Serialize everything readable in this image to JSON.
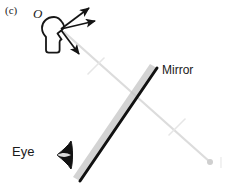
{
  "figure": {
    "panel_label": "(c)",
    "background_color": "#ffffff"
  },
  "labels": {
    "object": "O",
    "mirror": "Mirror",
    "eye": "Eye"
  },
  "colors": {
    "ink": "#1a1a1a",
    "mirror_line": "#111111",
    "mirror_backing": "#b4b4b4",
    "ray_gray": "#d8d8d8",
    "tick_gray": "#e2e2e2",
    "image_point": "#cfcfcf",
    "eye_fill": "#111111"
  },
  "scene": {
    "object_head": {
      "name": "head-silhouette",
      "center_x": 54,
      "center_y": 33
    },
    "emitted_rays": [
      {
        "name": "ray-up-right",
        "x1": 60,
        "y1": 28,
        "x2": 91,
        "y2": 6
      },
      {
        "name": "ray-right",
        "x1": 60,
        "y1": 28,
        "x2": 97,
        "y2": 20
      },
      {
        "name": "ray-down-right",
        "x1": 60,
        "y1": 28,
        "x2": 80,
        "y2": 55
      }
    ],
    "mirror": {
      "x1": 157,
      "y1": 68,
      "x2": 80,
      "y2": 181,
      "thickness": 3
    },
    "sight_line": {
      "name": "line-of-sight-to-image",
      "x1": 64,
      "y1": 32,
      "x2": 210,
      "y2": 162,
      "tick_marks": [
        {
          "x": 96,
          "y": 66
        },
        {
          "x": 177,
          "y": 127
        }
      ]
    },
    "image_point": {
      "name": "virtual-image-point",
      "x": 210,
      "y": 162,
      "radius": 3
    },
    "eye": {
      "name": "eye-symbol",
      "x": 70,
      "y": 155
    }
  }
}
